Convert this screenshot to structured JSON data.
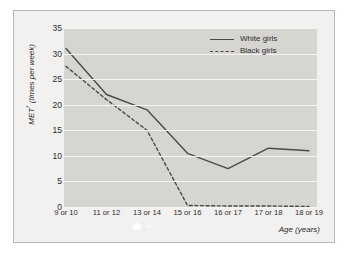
{
  "chart_data": {
    "type": "line",
    "title": "",
    "xlabel": "Age (years)",
    "ylabel": "MET (times per week)",
    "ylabel_marker": "*",
    "categories": [
      "9 or 10",
      "11 or 12",
      "13 or 14",
      "15 or 16",
      "16 or 17",
      "17 or 18",
      "18 or 19"
    ],
    "ylim": [
      0,
      35
    ],
    "yticks": [
      0,
      5,
      10,
      15,
      20,
      25,
      30,
      35
    ],
    "grid": true,
    "legend_position": "top-right",
    "series": [
      {
        "name": "White girls",
        "style": "solid",
        "color": "#4a4a4a",
        "values": [
          31,
          22,
          19,
          10.5,
          7.5,
          11.5,
          11
        ]
      },
      {
        "name": "Black girls",
        "style": "dashed",
        "color": "#4a4a4a",
        "values": [
          27.5,
          21,
          15,
          0.3,
          0.2,
          0.2,
          0.1
        ]
      }
    ]
  },
  "legend": {
    "items": [
      {
        "label": "White girls",
        "style": "solid"
      },
      {
        "label": "Black girls",
        "style": "dashed"
      }
    ]
  },
  "colors": {
    "page_background": "#ffffff",
    "panel_background": "#f2f1ef",
    "panel_border": "#b9b7b3",
    "plot_background": "#d6d5d2",
    "gridline": "#f4f4f2",
    "line": "#4a4a4a",
    "text": "#2c2c2c"
  }
}
